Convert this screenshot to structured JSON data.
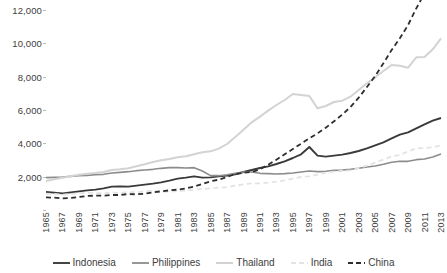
{
  "chart_data": {
    "type": "line",
    "title": "",
    "xlabel": "",
    "ylabel": "",
    "grid": false,
    "legend_position": "bottom",
    "xlim": [
      1965,
      2013
    ],
    "ylim": [
      0,
      12000
    ],
    "y_ticks": [
      "2,000",
      "4,000",
      "6,000",
      "8,000",
      "10,000",
      "12,000"
    ],
    "y_tick_values": [
      2000,
      4000,
      6000,
      8000,
      10000,
      12000
    ],
    "x": [
      1965,
      1966,
      1967,
      1968,
      1969,
      1970,
      1971,
      1972,
      1973,
      1974,
      1975,
      1976,
      1977,
      1978,
      1979,
      1980,
      1981,
      1982,
      1983,
      1984,
      1985,
      1986,
      1987,
      1988,
      1989,
      1990,
      1991,
      1992,
      1993,
      1994,
      1995,
      1996,
      1997,
      1998,
      1999,
      2000,
      2001,
      2002,
      2003,
      2004,
      2005,
      2006,
      2007,
      2008,
      2009,
      2010,
      2011,
      2012,
      2013
    ],
    "x_tick_labels": [
      "1965",
      "1967",
      "1969",
      "1971",
      "1973",
      "1975",
      "1977",
      "1979",
      "1981",
      "1983",
      "1985",
      "1987",
      "1989",
      "1991",
      "1993",
      "1995",
      "1997",
      "1999",
      "2001",
      "2003",
      "2005",
      "2007",
      "2009",
      "2011",
      "2013"
    ],
    "series": [
      {
        "name": "Indonesia",
        "color": "#3a3a3a",
        "style": "solid",
        "width": 1.9,
        "values": [
          1080,
          1040,
          1000,
          1060,
          1120,
          1180,
          1220,
          1300,
          1400,
          1420,
          1400,
          1460,
          1520,
          1580,
          1660,
          1760,
          1880,
          1940,
          2020,
          1940,
          1960,
          2020,
          2060,
          2140,
          2280,
          2400,
          2520,
          2620,
          2760,
          2920,
          3120,
          3340,
          3780,
          3260,
          3200,
          3260,
          3320,
          3420,
          3540,
          3700,
          3880,
          4060,
          4300,
          4520,
          4660,
          4900,
          5140,
          5360,
          5520
        ]
      },
      {
        "name": "Philippines",
        "color": "#8c8c8c",
        "style": "solid",
        "width": 1.6,
        "values": [
          1940,
          1960,
          1980,
          2020,
          2060,
          2080,
          2120,
          2140,
          2220,
          2260,
          2300,
          2360,
          2400,
          2440,
          2500,
          2540,
          2540,
          2520,
          2540,
          2340,
          2060,
          2060,
          2120,
          2200,
          2280,
          2280,
          2200,
          2180,
          2160,
          2180,
          2220,
          2280,
          2340,
          2300,
          2320,
          2380,
          2400,
          2440,
          2500,
          2580,
          2640,
          2740,
          2860,
          2920,
          2920,
          3020,
          3060,
          3180,
          3360
        ]
      },
      {
        "name": "Thailand",
        "color": "#d3d3d3",
        "style": "solid",
        "width": 2.0,
        "values": [
          1740,
          1840,
          1940,
          2020,
          2120,
          2180,
          2220,
          2280,
          2400,
          2440,
          2500,
          2620,
          2740,
          2880,
          2980,
          3060,
          3160,
          3220,
          3340,
          3460,
          3520,
          3680,
          3960,
          4380,
          4820,
          5260,
          5600,
          5960,
          6300,
          6600,
          6960,
          6900,
          6840,
          6100,
          6240,
          6480,
          6560,
          6800,
          7200,
          7600,
          7960,
          8340,
          8700,
          8660,
          8540,
          9160,
          9180,
          9640,
          10300
        ]
      },
      {
        "name": "India",
        "color": "#e3e3e3",
        "style": "dashed",
        "width": 1.8,
        "values": [
          980,
          960,
          920,
          960,
          1000,
          1040,
          1020,
          1000,
          1040,
          1020,
          1080,
          1060,
          1120,
          1160,
          1080,
          1100,
          1140,
          1160,
          1220,
          1260,
          1300,
          1340,
          1360,
          1460,
          1540,
          1600,
          1600,
          1640,
          1700,
          1780,
          1880,
          1980,
          2020,
          2120,
          2240,
          2300,
          2340,
          2380,
          2520,
          2660,
          2840,
          3020,
          3220,
          3300,
          3520,
          3700,
          3720,
          3760,
          3880
        ]
      },
      {
        "name": "China",
        "color": "#2e2e2e",
        "style": "dashed",
        "width": 1.8,
        "values": [
          760,
          740,
          700,
          720,
          780,
          840,
          860,
          860,
          900,
          900,
          960,
          940,
          980,
          1060,
          1120,
          1180,
          1220,
          1300,
          1400,
          1560,
          1720,
          1820,
          1980,
          2160,
          2240,
          2280,
          2440,
          2720,
          3020,
          3340,
          3660,
          3980,
          4300,
          4600,
          4940,
          5320,
          5720,
          6180,
          6740,
          7380,
          8040,
          8800,
          9600,
          10300,
          11100,
          12100,
          13000,
          13900,
          14800
        ]
      }
    ]
  }
}
